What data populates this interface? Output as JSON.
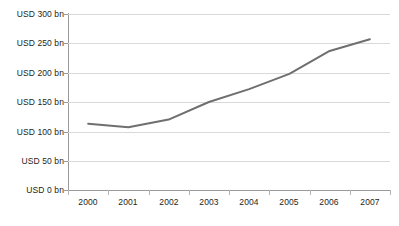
{
  "chart_data": {
    "type": "line",
    "title": "",
    "subtitle": "",
    "xlabel": "",
    "ylabel": "",
    "categories": [
      "2000",
      "2001",
      "2002",
      "2003",
      "2004",
      "2005",
      "2006",
      "2007"
    ],
    "values": [
      113,
      107,
      120,
      150,
      172,
      198,
      237,
      257
    ],
    "series": [
      {
        "name": "",
        "values": [
          113,
          107,
          120,
          150,
          172,
          198,
          237,
          257
        ]
      }
    ],
    "ylim": [
      0,
      300
    ],
    "yticks": [
      0,
      50,
      100,
      150,
      200,
      250,
      300
    ],
    "ytick_labels": [
      "USD 0 bn",
      "USD 50 bn",
      "USD 100 bn",
      "USD 150 bn",
      "USD 200 bn",
      "USD 250 bn",
      "USD 300 bn"
    ],
    "xtick_labels": [
      "2000",
      "2001",
      "2002",
      "2003",
      "2004",
      "2005",
      "2006",
      "2007"
    ],
    "unit": "USD bn",
    "grid": true,
    "grid_axis": "y",
    "legend": false,
    "legend_position": "none",
    "annotations": [],
    "colors": {
      "line": "#6f6f6f",
      "gridline": "#d9d9d9",
      "axis": "#9a9a9a",
      "text": "#231f20",
      "background": "#ffffff"
    },
    "line_width": 2,
    "markers": false
  }
}
